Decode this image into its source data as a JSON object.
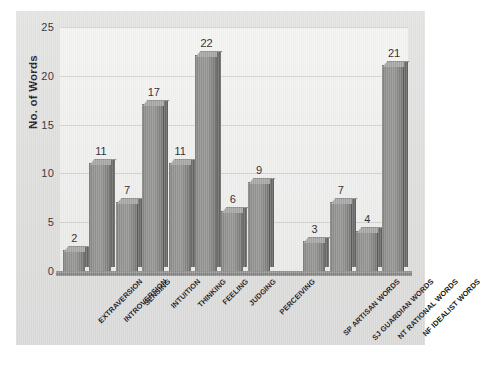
{
  "chart_data": {
    "type": "bar",
    "title": "",
    "xlabel": "",
    "ylabel": "No. of Words",
    "ylim": [
      0,
      25
    ],
    "yticks": [
      0,
      5,
      10,
      15,
      20,
      25
    ],
    "grid": true,
    "legend": "none",
    "orientation": "vertical",
    "value_labels": true,
    "categories": [
      "EXTRAVERSION",
      "INTROVERSION",
      "SENSING",
      "INTUITION",
      "THINKING",
      "FEELING",
      "JUDGING",
      "PERCEIVING",
      "SP ARTISAN WORDS",
      "SJ GUARDIAN WORDS",
      "NT RATIONAL WORDS",
      "NF IDEALIST WORDS"
    ],
    "values": [
      2,
      11,
      7,
      17,
      11,
      22,
      6,
      9,
      3,
      7,
      4,
      21
    ],
    "group_break_after_index": 7,
    "bar_color": "#8f8f8e",
    "bar_shade_color": "#6d6d6c",
    "bar_top_color": "#a5a5a4",
    "plot_background": "#eeeeed",
    "frame_background": "#dedede",
    "axis_color": "#7a7a79",
    "text_color": "#1e1e1e"
  }
}
